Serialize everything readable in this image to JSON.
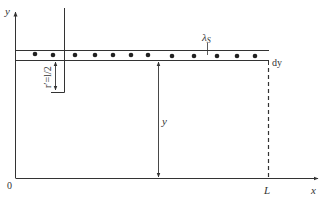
{
  "diagram": {
    "axes": {
      "y_label": "y",
      "x_label": "x",
      "origin_label": "0",
      "length_label": "L"
    },
    "strip": {
      "charge_density_label": "λ",
      "charge_density_subscript": "S",
      "thickness_label": "dy",
      "charge_count": 12
    },
    "rod": {
      "distance_label": "r′=l/2"
    },
    "height_label": "y"
  },
  "colors": {
    "stroke": "#333333",
    "background": "#ffffff"
  }
}
